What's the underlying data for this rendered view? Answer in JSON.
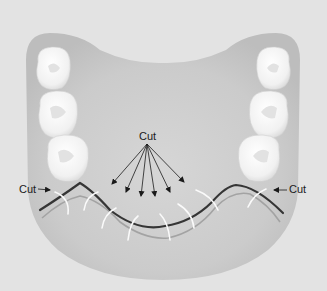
{
  "diagram": {
    "labels": {
      "top_center": "Cut",
      "left": "Cut",
      "right": "Cut"
    },
    "colors": {
      "background": "#e3e3e3",
      "gum": "#c4c4c4",
      "gum_inner": "#d2d2d2",
      "tooth": "#f7f7f7",
      "tooth_shadow": "#d8d8d8",
      "incision_line": "#3a3a3a",
      "incision_shadow": "#9a9a9a",
      "suture": "#fafafa",
      "arrow": "#1a1a1a"
    },
    "teeth": {
      "left_count": 3,
      "right_count": 3
    },
    "center_arrow_count": 6,
    "suture_count": 10
  }
}
